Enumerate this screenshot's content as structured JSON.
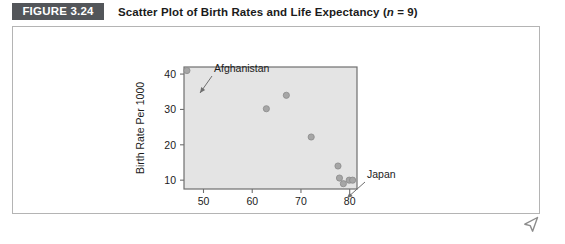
{
  "figure": {
    "badge_label": "FIGURE 3.24",
    "title_main": "Scatter Plot of Birth Rates and Life Expectancy (",
    "title_italic_n": "n",
    "title_tail": " = 9)",
    "title_full": "Scatter Plot of Birth Rates and Life Expectancy (n = 9)",
    "badge_bg": "#53565a",
    "badge_fg": "#ffffff",
    "panel_border": "#b4b4b4"
  },
  "cursor": {
    "icon": "mouse-pointer-icon",
    "color": "#8c8c8c"
  },
  "chart_data": {
    "type": "scatter",
    "title": "Scatter Plot of Birth Rates and Life Expectancy (n = 9)",
    "xlabel": "Life Expectancy (years)",
    "ylabel": "Birth Rate Per 1000",
    "xlim": [
      46,
      81.5
    ],
    "ylim": [
      7.5,
      42
    ],
    "xticks": [
      50,
      60,
      70,
      80
    ],
    "yticks": [
      10,
      20,
      30,
      40
    ],
    "grid": false,
    "legend": false,
    "plot_bg": "#e4e4e4",
    "frame_color": "#6f6f6f",
    "point_fill": "#a6a6a6",
    "point_stroke": "#8a8a8a",
    "point_radius": 3.1,
    "points": [
      {
        "x": 46.6,
        "y": 41.0,
        "label": "Afghanistan"
      },
      {
        "x": 62.9,
        "y": 30.2,
        "label": ""
      },
      {
        "x": 67.0,
        "y": 34.0,
        "label": ""
      },
      {
        "x": 72.1,
        "y": 22.2,
        "label": ""
      },
      {
        "x": 77.6,
        "y": 14.0,
        "label": ""
      },
      {
        "x": 77.9,
        "y": 10.6,
        "label": ""
      },
      {
        "x": 78.7,
        "y": 9.0,
        "label": ""
      },
      {
        "x": 79.9,
        "y": 10.0,
        "label": ""
      },
      {
        "x": 80.6,
        "y": 10.0,
        "label": "Japan"
      }
    ],
    "annotations": [
      {
        "text": "Afghanistan",
        "text_x": 202,
        "text_y": 46,
        "arrow_from_x": 200,
        "arrow_from_y": 50,
        "arrow_to_x": 188,
        "arrow_to_y": 67
      },
      {
        "text": "Japan",
        "text_x": 355,
        "text_y": 152,
        "arrow_from_x": 353,
        "arrow_from_y": 156,
        "arrow_to_x": 335,
        "arrow_to_y": 172
      }
    ]
  }
}
